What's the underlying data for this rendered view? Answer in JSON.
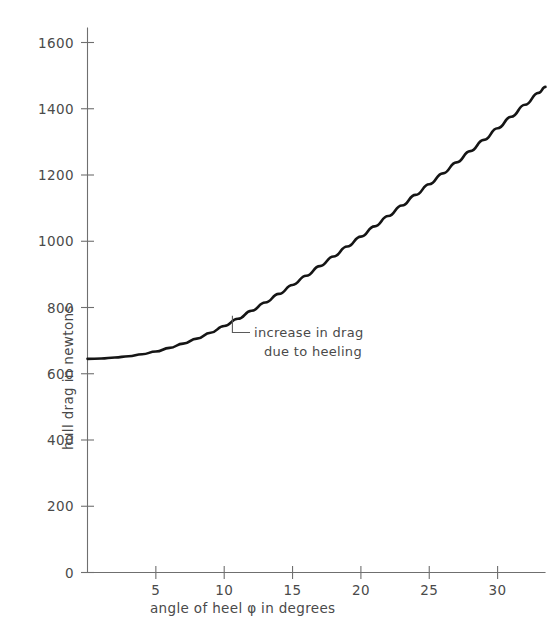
{
  "chart_data": {
    "type": "line",
    "title": "",
    "xlabel": "angle of heel φ in degrees",
    "ylabel": "hull drag in newtons",
    "xlim": [
      0,
      33.5
    ],
    "ylim": [
      0,
      1700
    ],
    "grid": false,
    "legend": null,
    "xticks": [
      5,
      10,
      15,
      20,
      25,
      30
    ],
    "xtick_labels": [
      "5",
      "10",
      "15",
      "20",
      "25",
      "30"
    ],
    "yticks": [
      0,
      200,
      400,
      600,
      800,
      1000,
      1200,
      1400,
      1600
    ],
    "ytick_labels": [
      "0",
      "200",
      "400",
      "600",
      "800",
      "1000",
      "1200",
      "1400",
      "1600"
    ],
    "series": [
      {
        "name": "hull drag",
        "x": [
          0,
          1,
          2,
          3,
          4,
          5,
          6,
          7,
          8,
          9,
          10,
          11,
          12,
          13,
          14,
          15,
          16,
          17,
          18,
          19,
          20,
          21,
          22,
          23,
          24,
          25,
          26,
          27,
          28,
          29,
          30,
          31,
          32,
          33,
          33.5
        ],
        "y": [
          645,
          646,
          649,
          653,
          659,
          667,
          678,
          691,
          706,
          724,
          744,
          766,
          790,
          815,
          841,
          868,
          896,
          925,
          954,
          984,
          1014,
          1045,
          1076,
          1108,
          1140,
          1172,
          1205,
          1238,
          1272,
          1306,
          1341,
          1376,
          1412,
          1448,
          1466
        ]
      }
    ],
    "annotations": [
      {
        "name": "increase-in-drag",
        "line1": "increase in drag",
        "line2": "due to heeling",
        "point_x": 10.6,
        "point_y": 775
      }
    ]
  },
  "axes": {
    "y_title": "hull drag in newtons",
    "x_title": "angle of heel φ in degrees"
  },
  "colors": {
    "curve": "#151515",
    "axis": "#6f6f6f",
    "text": "#4a4a4a",
    "background": "#ffffff"
  }
}
